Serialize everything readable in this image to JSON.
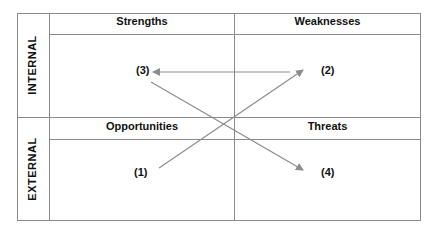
{
  "rows": [
    {
      "label": "INTERNAL"
    },
    {
      "label": "EXTERNAL"
    }
  ],
  "quadrants": {
    "strengths": {
      "title": "Strengths"
    },
    "weaknesses": {
      "title": "Weaknesses"
    },
    "opportunities": {
      "title": "Opportunities"
    },
    "threats": {
      "title": "Threats"
    }
  },
  "points": {
    "p1": "(1)",
    "p2": "(2)",
    "p3": "(3)",
    "p4": "(4)"
  },
  "arrows": [
    {
      "from": "(1)",
      "to": "(2)"
    },
    {
      "from": "(2)",
      "to": "(3)"
    },
    {
      "from": "(3)",
      "to": "(4)"
    }
  ],
  "colors": {
    "line": "#8a8a8a",
    "arrow": "#8c8c8c",
    "text": "#111111"
  }
}
